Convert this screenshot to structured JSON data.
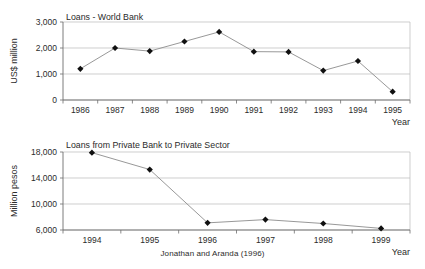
{
  "figure": {
    "caption": "Jonathan and Aranda (1996)",
    "accent_color": "#101010",
    "line_color": "#8c8c8c",
    "grid_color": "#b9b9b9",
    "axis_color": "#6d6d6d"
  },
  "chart_data": [
    {
      "type": "line",
      "id": "loans-world-bank",
      "title": "Loans - World Bank",
      "xlabel": "Year",
      "ylabel": "US$ million",
      "categories": [
        "1986",
        "1987",
        "1988",
        "1989",
        "1990",
        "1991",
        "1992",
        "1993",
        "1994",
        "1995"
      ],
      "values": [
        1200,
        2000,
        1880,
        2250,
        2620,
        1860,
        1850,
        1130,
        1500,
        320
      ],
      "ylim": [
        0,
        3000
      ],
      "yticks": [
        0,
        1000,
        2000,
        3000
      ],
      "ytick_labels": [
        "0",
        "1,000",
        "2,000",
        "3,000"
      ],
      "grid": true,
      "legend": "none",
      "marker": "diamond"
    },
    {
      "type": "line",
      "id": "loans-private-bank-private-sector",
      "title": "Loans from Private Bank to Private Sector",
      "xlabel": "Year",
      "ylabel": "Million pesos",
      "categories": [
        "1994",
        "1995",
        "1996",
        "1997",
        "1998",
        "1999"
      ],
      "values": [
        17900,
        15300,
        7100,
        7600,
        7000,
        6250
      ],
      "ylim": [
        6000,
        18000
      ],
      "yticks": [
        6000,
        10000,
        14000,
        18000
      ],
      "ytick_labels": [
        "6,000",
        "10,000",
        "14,000",
        "18,000"
      ],
      "grid": true,
      "legend": "none",
      "marker": "diamond"
    }
  ]
}
